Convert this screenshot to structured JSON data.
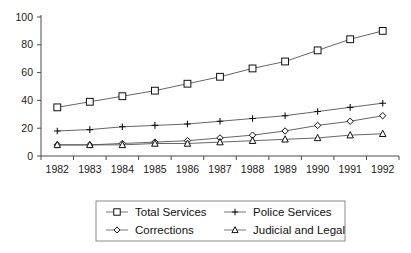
{
  "chart_data": {
    "type": "line",
    "title": "",
    "xlabel": "",
    "ylabel": "",
    "categories": [
      "1982",
      "1983",
      "1984",
      "1985",
      "1986",
      "1987",
      "1988",
      "1989",
      "1990",
      "1991",
      "1992"
    ],
    "x": [
      1982,
      1983,
      1984,
      1985,
      1986,
      1987,
      1988,
      1989,
      1990,
      1991,
      1992
    ],
    "ylim": [
      0,
      100
    ],
    "yticks": [
      0,
      20,
      40,
      60,
      80,
      100
    ],
    "ytick_labels": [
      "0",
      "20",
      "40",
      "60",
      "80",
      "100"
    ],
    "grid": false,
    "legend_position": "below-center",
    "series": [
      {
        "name": "Total Services",
        "marker": "square",
        "values": [
          35,
          39,
          43,
          47,
          52,
          57,
          63,
          68,
          76,
          84,
          90
        ]
      },
      {
        "name": "Police Services",
        "marker": "plus",
        "values": [
          18,
          19,
          21,
          22,
          23,
          25,
          27,
          29,
          32,
          35,
          38
        ]
      },
      {
        "name": "Corrections",
        "marker": "diamond",
        "values": [
          8,
          8,
          9,
          10,
          11,
          13,
          15,
          18,
          22,
          25,
          29
        ]
      },
      {
        "name": "Judicial and Legal",
        "marker": "triangle",
        "values": [
          8,
          8,
          8,
          9,
          9,
          10,
          11,
          12,
          13,
          15,
          16
        ]
      }
    ]
  },
  "colors": {
    "axis": "#4a4a4a",
    "line": "#555555",
    "marker_stroke": "#111111",
    "marker_fill": "#ffffff",
    "text": "#1a1a1a",
    "legend_border": "#8a8a8a",
    "background": "#ffffff"
  },
  "legend": {
    "entries": [
      {
        "label": "Total Services",
        "marker": "square"
      },
      {
        "label": "Police Services",
        "marker": "plus"
      },
      {
        "label": "Corrections",
        "marker": "diamond"
      },
      {
        "label": "Judicial and Legal",
        "marker": "triangle"
      }
    ]
  }
}
